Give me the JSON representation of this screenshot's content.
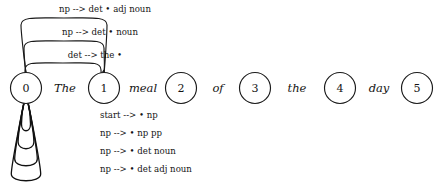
{
  "chart_data": {
    "type": "diagram",
    "title": "",
    "diagram_kind": "chart-parser-state-chart",
    "nodes": [
      {
        "id": "0",
        "label": "0",
        "cx": 26,
        "cy": 88,
        "r": 15.5
      },
      {
        "id": "1",
        "label": "1",
        "cx": 104,
        "cy": 88,
        "r": 15.5
      },
      {
        "id": "2",
        "label": "2",
        "cx": 181,
        "cy": 88,
        "r": 15.5
      },
      {
        "id": "3",
        "label": "3",
        "cx": 255,
        "cy": 88,
        "r": 15.5
      },
      {
        "id": "4",
        "label": "4",
        "cx": 340,
        "cy": 88,
        "r": 15.5
      },
      {
        "id": "5",
        "label": "5",
        "cx": 417,
        "cy": 88,
        "r": 15.5
      }
    ],
    "words": [
      {
        "text": "The",
        "x": 65,
        "y": 89,
        "from": "0",
        "to": "1"
      },
      {
        "text": "meal",
        "x": 143,
        "y": 89,
        "from": "1",
        "to": "2"
      },
      {
        "text": "of",
        "x": 218,
        "y": 89,
        "from": "2",
        "to": "3"
      },
      {
        "text": "the",
        "x": 297,
        "y": 89,
        "from": "3",
        "to": "4"
      },
      {
        "text": "day",
        "x": 379,
        "y": 89,
        "from": "4",
        "to": "5"
      }
    ],
    "arcs": [
      {
        "label": "np --> det • adj noun",
        "from": "0",
        "to": "1",
        "label_x": 105,
        "label_y": 9,
        "apex_y": 18,
        "side_x_left": 21,
        "side_x_right": 107
      },
      {
        "label": "np --> det • noun",
        "from": "0",
        "to": "1",
        "label_x": 100,
        "label_y": 32,
        "apex_y": 41,
        "side_x_left": 24,
        "side_x_right": 104
      },
      {
        "label": "det --> the •",
        "from": "0",
        "to": "1",
        "label_x": 95,
        "label_y": 55,
        "apex_y": 63,
        "side_x_left": 25,
        "side_x_right": 101
      }
    ],
    "self_loops": [
      {
        "label": "start --> • np",
        "node": "0",
        "depth": 131,
        "label_x": 38,
        "label_y": 115
      },
      {
        "label": "np --> • np pp",
        "node": "0",
        "depth": 149,
        "label_x": 38,
        "label_y": 133
      },
      {
        "label": "np --> • det noun",
        "node": "0",
        "depth": 166,
        "label_x": 38,
        "label_y": 151
      },
      {
        "label": "np --> • det adj noun",
        "node": "0",
        "depth": 181,
        "label_x": 38,
        "label_y": 169
      }
    ],
    "colors": {
      "background": "#ffffff",
      "stroke": "#1a1a1a",
      "text": "#141414"
    }
  }
}
